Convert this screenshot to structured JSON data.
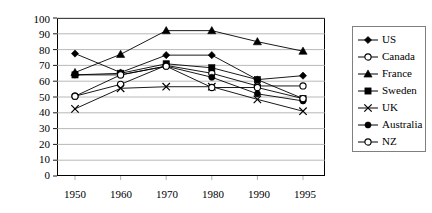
{
  "chart_data": {
    "type": "line",
    "title": "",
    "xlabel": "",
    "ylabel": "",
    "x": [
      "1950",
      "1960",
      "1970",
      "1980",
      "1990",
      "1995"
    ],
    "categories": [
      "1950",
      "1960",
      "1970",
      "1980",
      "1990",
      "1995"
    ],
    "ylim": [
      0,
      100
    ],
    "yticks": [
      0,
      10,
      20,
      30,
      40,
      50,
      60,
      70,
      80,
      90,
      100
    ],
    "grid": true,
    "legend_position": "right",
    "series": [
      {
        "name": "US",
        "marker": "filled-diamond",
        "values": [
          77.5,
          65.5,
          76.5,
          76.5,
          61,
          63.5
        ]
      },
      {
        "name": "Canada",
        "marker": "open-circle",
        "values": [
          50.5,
          58,
          70,
          65,
          57,
          57
        ]
      },
      {
        "name": "France",
        "marker": "filled-triangle",
        "values": [
          65.5,
          77,
          92,
          92,
          85,
          79
        ]
      },
      {
        "name": "Sweden",
        "marker": "filled-square",
        "values": [
          64,
          65,
          71,
          68.5,
          61,
          49
        ]
      },
      {
        "name": "UK",
        "marker": "cross",
        "values": [
          42.5,
          55.5,
          56.5,
          56.5,
          48.5,
          41
        ]
      },
      {
        "name": "Australia",
        "marker": "filled-circle",
        "values": [
          64,
          64,
          69.5,
          62.5,
          52,
          47.5
        ]
      },
      {
        "name": "NZ",
        "marker": "open-circle",
        "values": [
          50.5,
          64,
          69.5,
          56,
          56,
          49
        ]
      }
    ]
  },
  "legend": {
    "items": [
      {
        "label": "US",
        "marker": "filled-diamond"
      },
      {
        "label": "Canada",
        "marker": "open-circle"
      },
      {
        "label": "France",
        "marker": "filled-triangle"
      },
      {
        "label": "Sweden",
        "marker": "filled-square"
      },
      {
        "label": "UK",
        "marker": "cross"
      },
      {
        "label": "Australia",
        "marker": "filled-circle"
      },
      {
        "label": "NZ",
        "marker": "open-circle"
      }
    ]
  },
  "axes": {
    "y_tick_labels": [
      "100",
      "90",
      "80",
      "70",
      "60",
      "50",
      "40",
      "30",
      "20",
      "10",
      "0"
    ],
    "x_tick_labels": [
      "1950",
      "1960",
      "1970",
      "1980",
      "1990",
      "1995"
    ]
  },
  "colors": {
    "series_line": "#000000",
    "gridline": "#a6a6a6",
    "axis": "#000000",
    "legend_border": "#808080",
    "background": "#ffffff"
  }
}
